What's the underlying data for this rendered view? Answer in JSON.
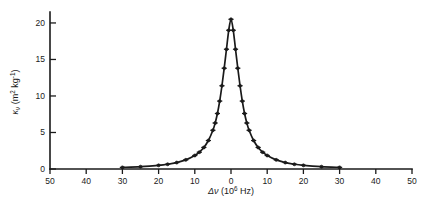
{
  "chart_data": {
    "type": "line",
    "title": "",
    "xlabel": "Δν  (10⁶ Hz)",
    "ylabel": "κν  (m² kg⁻¹)",
    "xlabel_parts": {
      "symbol": "Δν",
      "unit_open": "(10",
      "exponent": "6",
      "unit_close": " Hz)"
    },
    "ylabel_parts": {
      "symbol": "κ",
      "subscript": "ν",
      "unit_open": "(m",
      "unit_sup1": "2",
      "unit_mid": " kg",
      "unit_sup2": "-1",
      "unit_close": ")"
    },
    "xlim": [
      -50,
      50
    ],
    "ylim": [
      0,
      21.5
    ],
    "xticks": [
      -50,
      -40,
      -30,
      -20,
      -10,
      0,
      10,
      20,
      30,
      40,
      50
    ],
    "xticklabels": [
      "50",
      "40",
      "30",
      "20",
      "10",
      "0",
      "10",
      "20",
      "30",
      "40",
      "50"
    ],
    "yticks": [
      0,
      5,
      10,
      15,
      20
    ],
    "yticklabels": [
      "0",
      "5",
      "10",
      "15",
      "20"
    ],
    "grid": false,
    "legend": null,
    "marker": "plus-dot",
    "line_color": "#1a1a1a",
    "x": [
      -30,
      -25,
      -20,
      -17.5,
      -15,
      -12.5,
      -10,
      -8.75,
      -7.5,
      -6.25,
      -5,
      -4.375,
      -3.75,
      -3.125,
      -2.5,
      -1.875,
      -1.25,
      -0.625,
      0,
      0.625,
      1.25,
      1.875,
      2.5,
      3.125,
      3.75,
      4.375,
      5,
      6.25,
      7.5,
      8.75,
      10,
      12.5,
      15,
      17.5,
      20,
      25,
      30
    ],
    "values": [
      0.22,
      0.32,
      0.5,
      0.65,
      0.88,
      1.25,
      1.85,
      2.3,
      2.95,
      3.9,
      5.3,
      6.3,
      7.6,
      9.3,
      11.4,
      13.8,
      16.4,
      19.0,
      20.5,
      19.0,
      16.4,
      13.8,
      11.4,
      9.3,
      7.6,
      6.3,
      5.3,
      3.9,
      2.95,
      2.3,
      1.85,
      1.25,
      0.88,
      0.65,
      0.5,
      0.32,
      0.22
    ],
    "peak": {
      "x": 0,
      "y": 20.5
    },
    "halfwidth_hwhm": 2.5
  }
}
